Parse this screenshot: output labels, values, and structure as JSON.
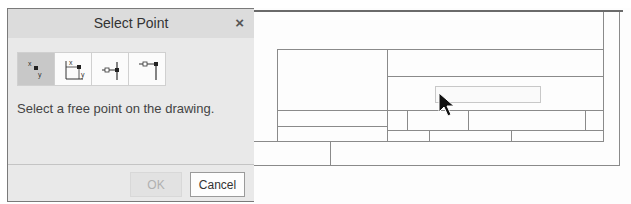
{
  "dialog": {
    "title": "Select Point",
    "close_label": "×",
    "tools": [
      {
        "name": "free-point-icon",
        "active": true
      },
      {
        "name": "absolute-coordinates-icon",
        "active": false
      },
      {
        "name": "point-on-vertical-line-icon",
        "active": false
      },
      {
        "name": "point-on-line-end-icon",
        "active": false
      }
    ],
    "message": "Select a free point on the drawing.",
    "ok_label": "OK",
    "cancel_label": "Cancel"
  },
  "colors": {
    "dialog_bg": "#e9e9e9",
    "title_bg": "#dcdcdc",
    "active_tool_bg": "#c8c8c8",
    "line": "#8a8a8a"
  }
}
